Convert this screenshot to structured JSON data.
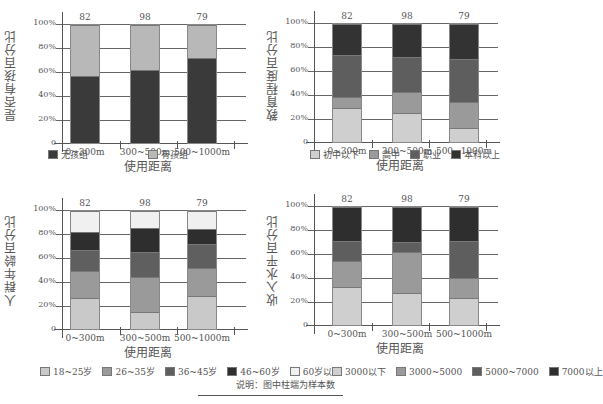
{
  "chart_data": [
    {
      "type": "bar",
      "stacked": true,
      "title": "",
      "xlabel": "使用距离",
      "ylabel": "是否有孩百分比",
      "categories": [
        "0~300m",
        "300~500m",
        "500~1000m"
      ],
      "sample_sizes": [
        82,
        98,
        79
      ],
      "ylim": [
        0,
        100
      ],
      "yticks": [
        "0",
        "20%",
        "40%",
        "60%",
        "80%",
        "100%"
      ],
      "series": [
        {
          "name": "无孩组",
          "color": "#3a3a3a",
          "values": [
            57,
            62,
            72
          ]
        },
        {
          "name": "有孩组",
          "color": "#b8b8b8",
          "values": [
            43,
            38,
            28
          ]
        }
      ],
      "grid": true,
      "legend_position": "bottom"
    },
    {
      "type": "bar",
      "stacked": true,
      "title": "",
      "xlabel": "使用距离",
      "ylabel": "教育程度百分比",
      "categories": [
        "0~300m",
        "300~500m",
        "500~1000m"
      ],
      "sample_sizes": [
        82,
        98,
        79
      ],
      "ylim": [
        0,
        100
      ],
      "yticks": [
        "0",
        "20%",
        "40%",
        "60%",
        "80%",
        "100%"
      ],
      "series": [
        {
          "name": "初中以下",
          "color": "#cfcfcf",
          "values": [
            29,
            25,
            12
          ]
        },
        {
          "name": "高中",
          "color": "#9a9a9a",
          "values": [
            9,
            17,
            22
          ]
        },
        {
          "name": "职业",
          "color": "#5e5e5e",
          "values": [
            36,
            30,
            36
          ]
        },
        {
          "name": "本科以上",
          "color": "#333333",
          "values": [
            26,
            28,
            30
          ]
        }
      ],
      "grid": true,
      "legend_position": "bottom"
    },
    {
      "type": "bar",
      "stacked": true,
      "title": "",
      "xlabel": "使用距离",
      "ylabel": "人群年龄百分比",
      "categories": [
        "0~300m",
        "300~500m",
        "500~1000m"
      ],
      "sample_sizes": [
        82,
        98,
        79
      ],
      "ylim": [
        0,
        100
      ],
      "yticks": [
        "0",
        "20%",
        "40%",
        "60%",
        "80%",
        "100%"
      ],
      "series": [
        {
          "name": "18~25岁",
          "color": "#c9c9c9",
          "values": [
            26,
            14,
            28
          ]
        },
        {
          "name": "26~35岁",
          "color": "#9a9a9a",
          "values": [
            23,
            30,
            24
          ]
        },
        {
          "name": "36~45岁",
          "color": "#5f5f5f",
          "values": [
            18,
            21,
            20
          ]
        },
        {
          "name": "46~60岁",
          "color": "#2e2e2e",
          "values": [
            15,
            21,
            13
          ]
        },
        {
          "name": "60岁以上",
          "color": "#f0f0f0",
          "values": [
            18,
            14,
            15
          ]
        }
      ],
      "grid": true,
      "legend_position": "bottom"
    },
    {
      "type": "bar",
      "stacked": true,
      "title": "",
      "xlabel": "使用距离",
      "ylabel": "收入水平百分比",
      "categories": [
        "0~300m",
        "300~500m",
        "500~1000m"
      ],
      "sample_sizes": [
        82,
        98,
        79
      ],
      "ylim": [
        0,
        100
      ],
      "yticks": [
        "0",
        "20%",
        "40%",
        "60%",
        "80%",
        "100%"
      ],
      "series": [
        {
          "name": "3000以下",
          "color": "#cfcfcf",
          "values": [
            32,
            27,
            23
          ]
        },
        {
          "name": "3000~5000",
          "color": "#9a9a9a",
          "values": [
            22,
            35,
            17
          ]
        },
        {
          "name": "5000~7000",
          "color": "#5e5e5e",
          "values": [
            17,
            8,
            31
          ]
        },
        {
          "name": "7000以上",
          "color": "#2e2e2e",
          "values": [
            29,
            30,
            29
          ]
        }
      ],
      "grid": true,
      "legend_position": "bottom"
    }
  ],
  "yticks": [
    "0",
    "20%",
    "40%",
    "60%",
    "80%",
    "100%"
  ],
  "xlabel": "使用距离",
  "categories": [
    "0~300m",
    "300~500m",
    "500~1000m"
  ],
  "sample_sizes": [
    "82",
    "98",
    "79"
  ],
  "charts": [
    {
      "ylabel": "是否有孩百分比",
      "legend": [
        "无孩组",
        "有孩组"
      ]
    },
    {
      "ylabel": "教育程度百分比",
      "legend": [
        "初中以下",
        "高中",
        "职业",
        "本科以上"
      ]
    },
    {
      "ylabel": "人群年龄百分比",
      "legend": [
        "18~25岁",
        "26~35岁",
        "36~45岁",
        "46~60岁",
        "60岁以上"
      ]
    },
    {
      "ylabel": "收入水平百分比",
      "legend": [
        "3000以下",
        "3000~5000",
        "5000~7000",
        "7000以上"
      ]
    }
  ],
  "note": "说明：图中柱端为样本数"
}
